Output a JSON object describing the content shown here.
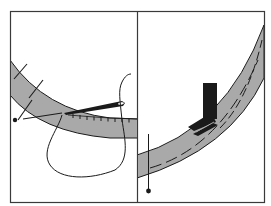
{
  "diagram": {
    "colors": {
      "background": "#ffffff",
      "ink": "#1a1a1a",
      "band_fill": "#a9a9a9",
      "frame": "#3a3a3a"
    },
    "panels": [
      {
        "id": "left",
        "label": "",
        "elements": [
          "curved-band",
          "hand-needle",
          "thread",
          "tack-marks",
          "pin",
          "stitch-ticks"
        ]
      },
      {
        "id": "right",
        "label": "",
        "elements": [
          "curved-band",
          "presser-foot",
          "dashed-stitch-lines",
          "pin"
        ]
      }
    ]
  }
}
